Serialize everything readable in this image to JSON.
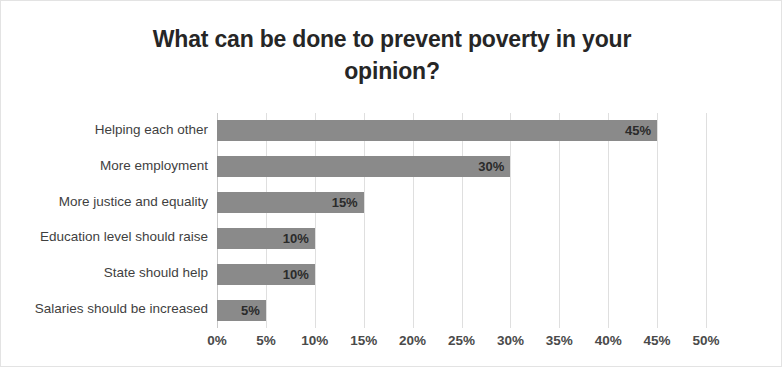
{
  "chart_data": {
    "type": "bar",
    "orientation": "horizontal",
    "title": "What can be done to prevent poverty in your opinion?",
    "title_line1": "What can be done to prevent poverty in your",
    "title_line2": "opinion?",
    "categories": [
      "Helping each other",
      "More employment",
      "More justice and equality",
      "Education level should raise",
      "State should help",
      "Salaries should be increased"
    ],
    "values": [
      45,
      30,
      15,
      10,
      10,
      5
    ],
    "data_labels": [
      "45%",
      "30%",
      "15%",
      "10%",
      "10%",
      "5%"
    ],
    "xlabel": "",
    "ylabel": "",
    "xlim": [
      0,
      50
    ],
    "xticks": [
      0,
      5,
      10,
      15,
      20,
      25,
      30,
      35,
      40,
      45,
      50
    ],
    "xtick_labels": [
      "0%",
      "5%",
      "10%",
      "15%",
      "20%",
      "25%",
      "30%",
      "35%",
      "40%",
      "45%",
      "50%"
    ],
    "grid": true,
    "grid_axis": "x",
    "legend": false,
    "bar_color": "#8a8a8a",
    "gridline_color": "#dfdfdf",
    "title_color": "#262626",
    "label_color": "#3f3f3f",
    "border_color": "#e3e3e3"
  }
}
